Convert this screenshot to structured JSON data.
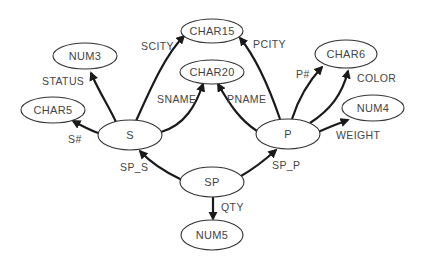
{
  "diagram": {
    "type": "entity-attribute graph",
    "nodes": [
      {
        "id": "CHAR15",
        "label": "CHAR15"
      },
      {
        "id": "NUM3",
        "label": "NUM3"
      },
      {
        "id": "CHAR20",
        "label": "CHAR20"
      },
      {
        "id": "CHAR6",
        "label": "CHAR6"
      },
      {
        "id": "CHAR5",
        "label": "CHAR5"
      },
      {
        "id": "NUM4",
        "label": "NUM4"
      },
      {
        "id": "S",
        "label": "S"
      },
      {
        "id": "P",
        "label": "P"
      },
      {
        "id": "SP",
        "label": "SP"
      },
      {
        "id": "NUM5",
        "label": "NUM5"
      }
    ],
    "edges": [
      {
        "from": "S",
        "to": "CHAR15",
        "label": "SCITY"
      },
      {
        "from": "P",
        "to": "CHAR15",
        "label": "PCITY"
      },
      {
        "from": "S",
        "to": "NUM3",
        "label": "STATUS"
      },
      {
        "from": "S",
        "to": "CHAR20",
        "label": "SNAME"
      },
      {
        "from": "P",
        "to": "CHAR20",
        "label": "PNAME"
      },
      {
        "from": "P",
        "to": "CHAR6",
        "label": "P#"
      },
      {
        "from": "P",
        "to": "CHAR6",
        "label": "COLOR"
      },
      {
        "from": "S",
        "to": "CHAR5",
        "label": "S#"
      },
      {
        "from": "P",
        "to": "NUM4",
        "label": "WEIGHT"
      },
      {
        "from": "SP",
        "to": "S",
        "label": "SP_S"
      },
      {
        "from": "SP",
        "to": "P",
        "label": "SP_P"
      },
      {
        "from": "SP",
        "to": "NUM5",
        "label": "QTY"
      }
    ]
  }
}
